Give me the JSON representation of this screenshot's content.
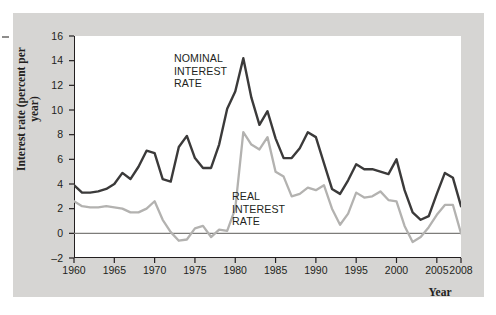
{
  "figure": {
    "background_color": "#ffffff",
    "mat_color": "#d6d5d3",
    "plot_background": "#ffffff"
  },
  "axes": {
    "y_title": "Interest rate\n(percent per year)",
    "x_title": "Year",
    "y_ticks": [
      "16",
      "14",
      "12",
      "10",
      "8",
      "6",
      "4",
      "2",
      "0",
      "–2"
    ],
    "x_ticks": [
      "1960",
      "1965",
      "1970",
      "1975",
      "1980",
      "1985",
      "1990",
      "1995",
      "2000",
      "2005",
      "2008"
    ]
  },
  "annotations": {
    "nominal": "NOMINAL\nINTEREST\nRATE",
    "real": "REAL\nINTEREST\nRATE"
  },
  "colors": {
    "nominal_line": "#3b3a3a",
    "real_line": "#b3b2b0",
    "axis": "#231f20",
    "zero_line": "#7d7c7a"
  },
  "chart_data": {
    "type": "line",
    "title": "",
    "xlabel": "Year",
    "ylabel": "Interest rate (percent per year)",
    "xlim": [
      1960,
      2008
    ],
    "ylim": [
      -2,
      16
    ],
    "grid": false,
    "legend": "inline-annotations",
    "zero_reference_line": 0,
    "x": [
      1960,
      1961,
      1962,
      1963,
      1964,
      1965,
      1966,
      1967,
      1968,
      1969,
      1970,
      1971,
      1972,
      1973,
      1974,
      1975,
      1976,
      1977,
      1978,
      1979,
      1980,
      1981,
      1982,
      1983,
      1984,
      1985,
      1986,
      1987,
      1988,
      1989,
      1990,
      1991,
      1992,
      1993,
      1994,
      1995,
      1996,
      1997,
      1998,
      1999,
      2000,
      2001,
      2002,
      2003,
      2004,
      2005,
      2006,
      2007,
      2008
    ],
    "series": [
      {
        "name": "NOMINAL INTEREST RATE",
        "color": "#3b3a3a",
        "values": [
          3.9,
          3.3,
          3.3,
          3.4,
          3.6,
          4.0,
          4.9,
          4.4,
          5.4,
          6.7,
          6.5,
          4.4,
          4.2,
          7.0,
          7.9,
          6.1,
          5.3,
          5.3,
          7.2,
          10.1,
          11.5,
          14.2,
          11.0,
          8.8,
          9.9,
          7.7,
          6.1,
          6.1,
          6.9,
          8.2,
          7.8,
          5.7,
          3.6,
          3.2,
          4.3,
          5.6,
          5.2,
          5.2,
          5.0,
          4.8,
          6.0,
          3.5,
          1.7,
          1.1,
          1.4,
          3.2,
          4.9,
          4.5,
          2.2
        ]
      },
      {
        "name": "REAL INTEREST RATE",
        "color": "#b3b2b0",
        "values": [
          2.6,
          2.2,
          2.1,
          2.1,
          2.2,
          2.1,
          2.0,
          1.7,
          1.7,
          2.0,
          2.6,
          1.1,
          0.1,
          -0.6,
          -0.5,
          0.4,
          0.6,
          -0.3,
          0.3,
          0.2,
          2.0,
          8.2,
          7.2,
          6.8,
          7.8,
          5.0,
          4.6,
          3.0,
          3.2,
          3.7,
          3.5,
          3.9,
          2.0,
          0.7,
          1.6,
          3.3,
          2.9,
          3.0,
          3.4,
          2.7,
          2.6,
          0.6,
          -0.7,
          -0.3,
          0.5,
          1.5,
          2.3,
          2.3,
          0.0
        ]
      }
    ]
  }
}
